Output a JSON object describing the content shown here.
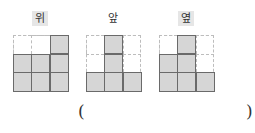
{
  "views": [
    {
      "label": "위",
      "shaded": true,
      "x": 13,
      "grid": [
        [
          0,
          0,
          1
        ],
        [
          1,
          1,
          1
        ],
        [
          1,
          1,
          1
        ]
      ]
    },
    {
      "label": "앞",
      "shaded": false,
      "x": 86,
      "grid": [
        [
          0,
          1,
          0
        ],
        [
          0,
          1,
          0
        ],
        [
          1,
          1,
          1
        ]
      ]
    },
    {
      "label": "옆",
      "shaded": true,
      "x": 159,
      "grid": [
        [
          0,
          1,
          0
        ],
        [
          1,
          1,
          0
        ],
        [
          1,
          1,
          1
        ]
      ]
    }
  ],
  "answer": {
    "open": "(",
    "close": ")",
    "value": ""
  },
  "colors": {
    "cell_fill": "#d6d6d6",
    "cell_border": "#6a6a6a",
    "guide_dash": "#bdbdbd",
    "label_bg": "#e6e6e6"
  }
}
